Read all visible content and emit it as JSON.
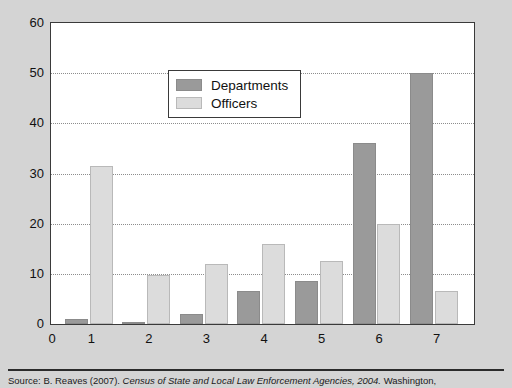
{
  "chart_data": {
    "type": "bar",
    "title": "",
    "subtitle": "",
    "xlabel": "",
    "ylabel": "",
    "categories": [
      "1",
      "2",
      "3",
      "4",
      "5",
      "6",
      "7"
    ],
    "series": [
      {
        "name": "Departments",
        "values": [
          1,
          0.5,
          2,
          6.5,
          8.5,
          36,
          50
        ],
        "color": "#9a9a9a"
      },
      {
        "name": "Officers",
        "values": [
          31.5,
          9.8,
          12,
          16,
          12.5,
          20,
          6.5
        ],
        "color": "#dcdcdc"
      }
    ],
    "ylim": [
      0,
      60
    ],
    "yticks": [
      0,
      10,
      20,
      30,
      40,
      50,
      60
    ],
    "xticks": [
      "0",
      "1",
      "2",
      "3",
      "4",
      "5",
      "6",
      "7"
    ],
    "gridlines": [
      10,
      20,
      30,
      40,
      50
    ],
    "grid": true,
    "grid_style": "dotted-horizontal",
    "legend_position": "upper-left-inside",
    "plot_background": "#ffffff",
    "figure_background": "#d4d4d4"
  },
  "legend": {
    "items": [
      {
        "label": "Departments",
        "swatch": "departments"
      },
      {
        "label": "Officers",
        "swatch": "officers"
      }
    ]
  },
  "y_axis": {
    "ticks": [
      {
        "label": "60",
        "value": 60
      },
      {
        "label": "50",
        "value": 50
      },
      {
        "label": "40",
        "value": 40
      },
      {
        "label": "30",
        "value": 30
      },
      {
        "label": "20",
        "value": 20
      },
      {
        "label": "10",
        "value": 10
      },
      {
        "label": "0",
        "value": 0
      }
    ]
  },
  "x_axis": {
    "ticks": [
      {
        "label": "0"
      },
      {
        "label": "1"
      },
      {
        "label": "2"
      },
      {
        "label": "3"
      },
      {
        "label": "4"
      },
      {
        "label": "5"
      },
      {
        "label": "6"
      },
      {
        "label": "7"
      }
    ]
  },
  "source": {
    "prefix": "Source: B. Reaves (2007). ",
    "italic_title": "Census of State and Local Law Enforcement Agencies, 2004.",
    "suffix": " Washington,"
  }
}
